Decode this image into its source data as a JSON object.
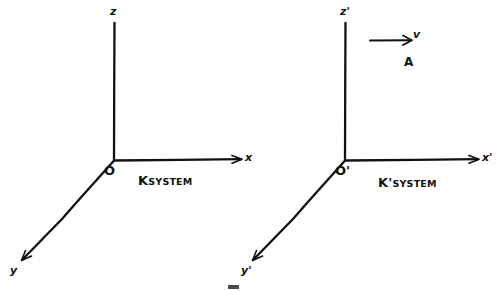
{
  "figure": {
    "background_color": "#ffffff",
    "ink_color": "#111111"
  },
  "systems": [
    {
      "id": "K",
      "name_prefix": "K",
      "name_suffix": "SYSTEM",
      "origin_label": "O",
      "axes": [
        {
          "name": "z-axis",
          "label": "z"
        },
        {
          "name": "x-axis",
          "label": "x"
        },
        {
          "name": "y-axis",
          "label": "y"
        }
      ]
    },
    {
      "id": "Kprime",
      "name_prefix": "K'",
      "name_suffix": "SYSTEM",
      "origin_label": "O'",
      "axes": [
        {
          "name": "z-axis",
          "label": "z'"
        },
        {
          "name": "x-axis",
          "label": "x'"
        },
        {
          "name": "y-axis",
          "label": "y'"
        }
      ]
    }
  ],
  "velocity": {
    "label": "v",
    "direction": "right"
  },
  "point": {
    "label": "A"
  }
}
